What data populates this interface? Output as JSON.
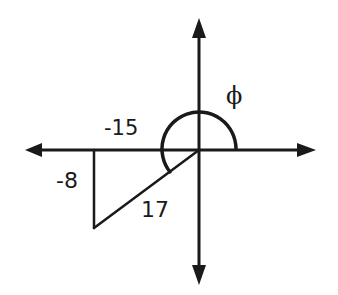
{
  "diagram": {
    "type": "reference-angle-triangle",
    "axes": {
      "horizontal": {
        "arrows": [
          "left",
          "right"
        ]
      },
      "vertical": {
        "arrows": [
          "up",
          "down"
        ]
      }
    },
    "triangle": {
      "quadrant": "III",
      "x_leg_label": "-15",
      "y_leg_label": "-8",
      "hypotenuse_label": "17"
    },
    "angle": {
      "label": "ϕ",
      "from": "positive x-axis",
      "direction": "counterclockwise",
      "terminal_side": "hypotenuse in quadrant III"
    },
    "colors": {
      "stroke": "#1a1a1a",
      "background": "#ffffff"
    }
  }
}
